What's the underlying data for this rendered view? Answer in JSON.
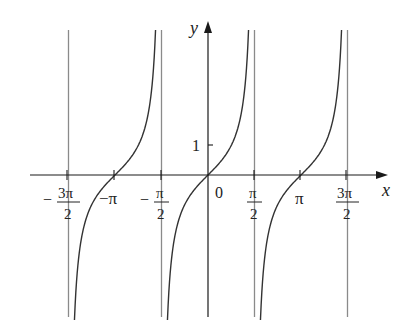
{
  "chart_data": {
    "type": "line",
    "title": "",
    "function": "y = tan x",
    "xlabel": "x",
    "ylabel": "y",
    "xlim": [
      -4.9,
      5.5
    ],
    "ylim": [
      -4.85,
      4.85
    ],
    "grid": false,
    "legend": null,
    "x_ticks": [
      {
        "value": -4.712389,
        "label_num": "3π",
        "label_den": "2",
        "sign": "−"
      },
      {
        "value": -3.141593,
        "label": "−π"
      },
      {
        "value": -1.570796,
        "label_num": "π",
        "label_den": "2",
        "sign": "−"
      },
      {
        "value": 0,
        "label": "0"
      },
      {
        "value": 1.570796,
        "label_num": "π",
        "label_den": "2",
        "sign": ""
      },
      {
        "value": 3.141593,
        "label": "π"
      },
      {
        "value": 4.712389,
        "label_num": "3π",
        "label_den": "2",
        "sign": ""
      }
    ],
    "y_ticks": [
      {
        "value": 1,
        "label": "1"
      }
    ],
    "asymptotes": [
      -4.712389,
      -1.570796,
      1.570796,
      4.712389
    ],
    "series": [
      {
        "name": "tan x branch 1",
        "domain": [
          -4.712389,
          -1.570796
        ],
        "center": -3.141593
      },
      {
        "name": "tan x branch 2",
        "domain": [
          -1.570796,
          1.570796
        ],
        "center": 0
      },
      {
        "name": "tan x branch 3",
        "domain": [
          1.570796,
          4.712389
        ],
        "center": 3.141593
      }
    ]
  },
  "labels": {
    "x_axis": "x",
    "y_axis": "y",
    "origin": "0",
    "y_one": "1",
    "neg_pi": "−π",
    "pi": "π",
    "neg_sign": "−",
    "three_pi": "3π",
    "pi_sym": "π",
    "two": "2"
  },
  "colors": {
    "axis": "#1a1a1a",
    "curve": "#333333",
    "asymptote": "#8a8a8a"
  }
}
